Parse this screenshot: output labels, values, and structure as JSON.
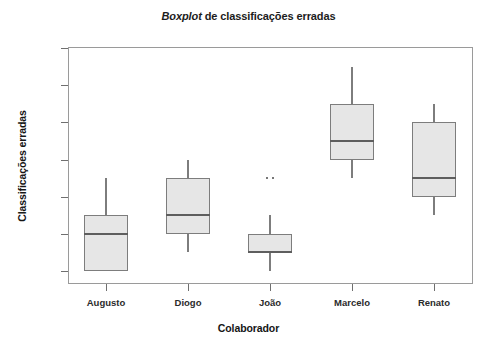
{
  "chart_data": {
    "type": "box",
    "title": "Boxplot de classificações erradas",
    "title_italic_word": "Boxplot",
    "title_rest": " de classificações erradas",
    "xlabel": "Colaborador",
    "ylabel": "Classificações erradas",
    "categories": [
      "Augusto",
      "Diogo",
      "João",
      "Marcelo",
      "Renato"
    ],
    "ylim": [
      0,
      12
    ],
    "yticks": [
      0,
      2,
      4,
      6,
      8,
      10,
      12
    ],
    "ytick_labels": [
      "0",
      "2",
      "4",
      "6",
      "8",
      "10",
      "12"
    ],
    "grid": false,
    "legend": "none",
    "box_fill_color": "#e6e6e6",
    "box_edge_color": "#7d7d7d",
    "median_color": "#5e5e5e",
    "boxes": [
      {
        "name": "Augusto",
        "whisker_low": 0,
        "q1": 0,
        "median": 2,
        "q3": 3,
        "whisker_high": 5,
        "outliers": []
      },
      {
        "name": "Diogo",
        "whisker_low": 1,
        "q1": 2,
        "median": 3,
        "q3": 5,
        "whisker_high": 6,
        "outliers": []
      },
      {
        "name": "João",
        "whisker_low": 0,
        "q1": 1,
        "median": 1,
        "q3": 2,
        "whisker_high": 3,
        "outliers": [
          5,
          5
        ]
      },
      {
        "name": "Marcelo",
        "whisker_low": 5,
        "q1": 6,
        "median": 7,
        "q3": 9,
        "whisker_high": 11,
        "outliers": []
      },
      {
        "name": "Renato",
        "whisker_low": 3,
        "q1": 4,
        "median": 5,
        "q3": 8,
        "whisker_high": 9,
        "outliers": []
      }
    ]
  }
}
